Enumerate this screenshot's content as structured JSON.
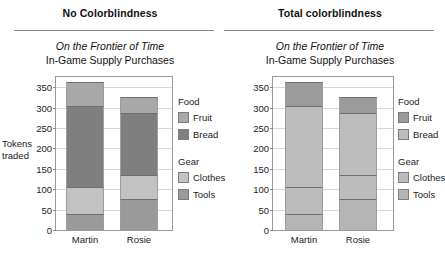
{
  "chart_data": [
    {
      "type": "bar",
      "variant": "stacked",
      "panel_title": "No Colorblindness",
      "title": "On the Frontier of Time",
      "subtitle": "In-Game Supply Purchases",
      "xlabel": "",
      "ylabel": "Tokens traded",
      "categories": [
        "Martin",
        "Rosie"
      ],
      "ylim": [
        0,
        375
      ],
      "yticks": [
        0,
        50,
        100,
        150,
        200,
        250,
        300,
        350
      ],
      "grid": true,
      "legend_position": "right",
      "legend_groups": [
        {
          "title": "Food",
          "entries": [
            {
              "label": "Fruit",
              "color": "#a8a8a8"
            },
            {
              "label": "Bread",
              "color": "#7f7f7f"
            }
          ]
        },
        {
          "title": "Gear",
          "entries": [
            {
              "label": "Clothes",
              "color": "#c2c2c2"
            },
            {
              "label": "Tools",
              "color": "#9a9a9a"
            }
          ]
        }
      ],
      "series": [
        {
          "name": "Tools",
          "color": "#9a9a9a",
          "values": [
            40,
            77
          ]
        },
        {
          "name": "Clothes",
          "color": "#c2c2c2",
          "values": [
            65,
            58
          ]
        },
        {
          "name": "Bread",
          "color": "#7f7f7f",
          "values": [
            200,
            151
          ]
        },
        {
          "name": "Fruit",
          "color": "#a8a8a8",
          "values": [
            58,
            40
          ]
        }
      ],
      "totals": [
        363,
        326
      ]
    },
    {
      "type": "bar",
      "variant": "stacked",
      "panel_title": "Total colorblindness",
      "title": "On the Frontier of Time",
      "subtitle": "In-Game Supply Purchases",
      "xlabel": "",
      "ylabel": "",
      "categories": [
        "Martin",
        "Rosie"
      ],
      "ylim": [
        0,
        375
      ],
      "yticks": [
        0,
        50,
        100,
        150,
        200,
        250,
        300,
        350
      ],
      "grid": true,
      "legend_position": "right",
      "legend_groups": [
        {
          "title": "Food",
          "entries": [
            {
              "label": "Fruit",
              "color": "#9b9b9b"
            },
            {
              "label": "Bread",
              "color": "#bdbdbd"
            }
          ]
        },
        {
          "title": "Gear",
          "entries": [
            {
              "label": "Clothes",
              "color": "#bcbcbc"
            },
            {
              "label": "Tools",
              "color": "#b5b5b5"
            }
          ]
        }
      ],
      "series": [
        {
          "name": "Tools",
          "color": "#b5b5b5",
          "values": [
            40,
            77
          ]
        },
        {
          "name": "Clothes",
          "color": "#bcbcbc",
          "values": [
            65,
            58
          ]
        },
        {
          "name": "Bread",
          "color": "#bdbdbd",
          "values": [
            200,
            151
          ]
        },
        {
          "name": "Fruit",
          "color": "#9b9b9b",
          "values": [
            58,
            40
          ]
        }
      ],
      "totals": [
        363,
        326
      ]
    }
  ],
  "panels": [
    {
      "panel_title": "No Colorblindness",
      "chart_title": "On the Frontier of Time",
      "chart_subtitle": "In-Game Supply Purchases",
      "axis_title": "Tokens traded",
      "yticks": [
        "350",
        "300",
        "250",
        "200",
        "150",
        "100",
        "50",
        "0"
      ],
      "xlabels": [
        "Martin",
        "Rosie"
      ],
      "legend": {
        "food_title": "Food",
        "gear_title": "Gear",
        "fruit": "Fruit",
        "bread": "Bread",
        "clothes": "Clothes",
        "tools": "Tools"
      }
    },
    {
      "panel_title": "Total colorblindness",
      "chart_title": "On the Frontier of Time",
      "chart_subtitle": "In-Game Supply Purchases",
      "axis_title": "",
      "yticks": [
        "350",
        "300",
        "250",
        "200",
        "150",
        "100",
        "50",
        "0"
      ],
      "xlabels": [
        "Martin",
        "Rosie"
      ],
      "legend": {
        "food_title": "Food",
        "gear_title": "Gear",
        "fruit": "Fruit",
        "bread": "Bread",
        "clothes": "Clothes",
        "tools": "Tools"
      }
    }
  ]
}
